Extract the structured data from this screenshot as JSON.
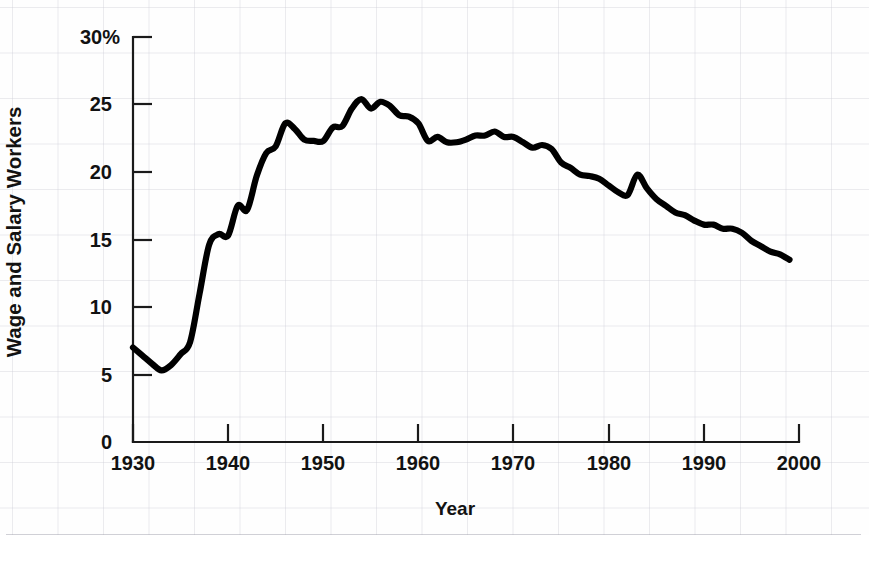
{
  "chart_data": {
    "type": "line",
    "title": "",
    "subtitle": "",
    "xlabel": "Year",
    "ylabel": "Wage and Salary Workers",
    "xlim": [
      1930,
      2000
    ],
    "ylim": [
      0,
      30
    ],
    "grid": "faint background graph-paper grid only; no plot gridlines",
    "legend": "none",
    "y_unit": "percent",
    "y_tick_labels": [
      "0",
      "5",
      "10",
      "15",
      "20",
      "25",
      "30%"
    ],
    "y_ticks": [
      0,
      5,
      10,
      15,
      20,
      25,
      30
    ],
    "x_tick_labels": [
      "1930",
      "1940",
      "1950",
      "1960",
      "1970",
      "1980",
      "1990",
      "2000"
    ],
    "x_ticks": [
      1930,
      1940,
      1950,
      1960,
      1970,
      1980,
      1990,
      2000
    ],
    "line_color": "#000000",
    "series": [
      {
        "name": "Union membership as percent of wage and salary workers",
        "x": [
          1930,
          1931,
          1932,
          1933,
          1934,
          1935,
          1936,
          1937,
          1938,
          1939,
          1940,
          1941,
          1942,
          1943,
          1944,
          1945,
          1946,
          1947,
          1948,
          1949,
          1950,
          1951,
          1952,
          1953,
          1954,
          1955,
          1956,
          1957,
          1958,
          1959,
          1960,
          1961,
          1962,
          1963,
          1964,
          1965,
          1966,
          1967,
          1968,
          1969,
          1970,
          1971,
          1972,
          1973,
          1974,
          1975,
          1976,
          1977,
          1978,
          1979,
          1980,
          1981,
          1982,
          1983,
          1984,
          1985,
          1986,
          1987,
          1988,
          1989,
          1990,
          1991,
          1992,
          1993,
          1994,
          1995,
          1996,
          1997,
          1998,
          1999
        ],
        "values": [
          7.0,
          6.4,
          5.8,
          5.3,
          5.7,
          6.5,
          7.4,
          11.0,
          14.6,
          15.4,
          15.3,
          17.5,
          17.2,
          19.7,
          21.4,
          21.9,
          23.6,
          23.2,
          22.4,
          22.3,
          22.3,
          23.3,
          23.4,
          24.7,
          25.4,
          24.7,
          25.2,
          24.9,
          24.2,
          24.1,
          23.6,
          22.3,
          22.6,
          22.2,
          22.2,
          22.4,
          22.7,
          22.7,
          23.0,
          22.6,
          22.6,
          22.2,
          21.8,
          22.0,
          21.7,
          20.7,
          20.3,
          19.8,
          19.7,
          19.5,
          19.0,
          18.5,
          18.3,
          19.8,
          18.8,
          18.0,
          17.5,
          17.0,
          16.8,
          16.4,
          16.1,
          16.1,
          15.8,
          15.8,
          15.5,
          14.9,
          14.5,
          14.1,
          13.9,
          13.5
        ],
        "annotations": [
          {
            "year": 1933,
            "value": 5.3,
            "note": "trough"
          },
          {
            "year": 1947,
            "value": 23.6,
            "note": "post-war high"
          },
          {
            "year": 1954,
            "value": 25.4,
            "note": "all-time peak"
          },
          {
            "year": 1983,
            "value": 19.8,
            "note": "local rebound"
          },
          {
            "year": 1999,
            "value": 13.5,
            "note": "series end"
          }
        ]
      }
    ]
  },
  "axes": {
    "ylabel": "Wage and Salary Workers",
    "xlabel": "Year",
    "y_tick_labels": [
      "30%",
      "25",
      "20",
      "15",
      "10",
      "5",
      "0"
    ],
    "x_tick_labels": [
      "1930",
      "1940",
      "1950",
      "1960",
      "1970",
      "1980",
      "1990",
      "2000"
    ]
  }
}
